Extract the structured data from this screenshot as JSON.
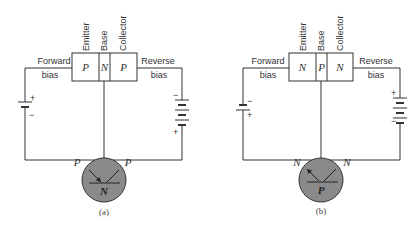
{
  "diagrams": [
    {
      "caption": "(a)",
      "type": "PNP",
      "regions": [
        "P",
        "N",
        "P"
      ],
      "terminal_labels": [
        "Emitter",
        "Base",
        "Collector"
      ],
      "left_bias": [
        "Forward",
        "bias"
      ],
      "right_bias": [
        "Reverse",
        "bias"
      ],
      "left_battery": {
        "top": "+",
        "bottom": "−"
      },
      "right_battery": {
        "top": "−",
        "bottom": "+"
      },
      "symbol": {
        "left": "P",
        "right": "P",
        "center": "N"
      }
    },
    {
      "caption": "(b)",
      "type": "NPN",
      "regions": [
        "N",
        "P",
        "N"
      ],
      "terminal_labels": [
        "Emitter",
        "Base",
        "Collector"
      ],
      "left_bias": [
        "Forward",
        "bias"
      ],
      "right_bias": [
        "Reverse",
        "bias"
      ],
      "left_battery": {
        "top": "−",
        "bottom": "+"
      },
      "right_battery": {
        "top": "+",
        "bottom": "−"
      },
      "symbol": {
        "left": "N",
        "right": "N",
        "center": "P"
      }
    }
  ],
  "colors": {
    "line": "#333333",
    "circle_fill": "#8a8a8a"
  }
}
